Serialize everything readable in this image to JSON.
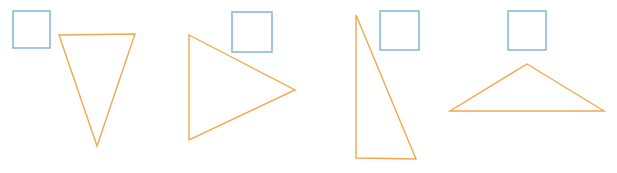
{
  "canvas": {
    "width": 617,
    "height": 173,
    "background_color": "#ffffff",
    "square_color": "#7BAEDB",
    "triangle_color": "#F0A84F",
    "stroke_width": 1.4
  },
  "chart_data": {
    "type": "scatter",
    "title": "",
    "xlabel": "",
    "ylabel": "",
    "xlim": [
      0,
      617
    ],
    "ylim": [
      0,
      173
    ],
    "grid": false,
    "legend": "none",
    "shape_count": 8,
    "series": [
      {
        "name": "squares",
        "shape": "square",
        "color": "#7BAEDB",
        "count": 4,
        "values": [
          {
            "id": "square-1",
            "x": 13,
            "y": 11,
            "width": 37,
            "height": 37
          },
          {
            "id": "square-2",
            "x": 232,
            "y": 12,
            "width": 40,
            "height": 40
          },
          {
            "id": "square-3",
            "x": 380,
            "y": 11,
            "width": 39,
            "height": 39
          },
          {
            "id": "square-4",
            "x": 508,
            "y": 11,
            "width": 38,
            "height": 39
          }
        ]
      },
      {
        "name": "triangles",
        "shape": "triangle",
        "color": "#F0A84F",
        "count": 4,
        "values": [
          {
            "id": "triangle-1",
            "orientation": "pointing-down",
            "points": "59,35 135,34 97,146"
          },
          {
            "id": "triangle-2",
            "orientation": "pointing-right",
            "points": "189,35 295,90 189,140"
          },
          {
            "id": "triangle-3",
            "orientation": "right-angle-left",
            "points": "356,15 416,159 356,158"
          },
          {
            "id": "triangle-4",
            "orientation": "pointing-up-wide",
            "points": "527,64 604,111 450,111"
          }
        ]
      }
    ]
  }
}
